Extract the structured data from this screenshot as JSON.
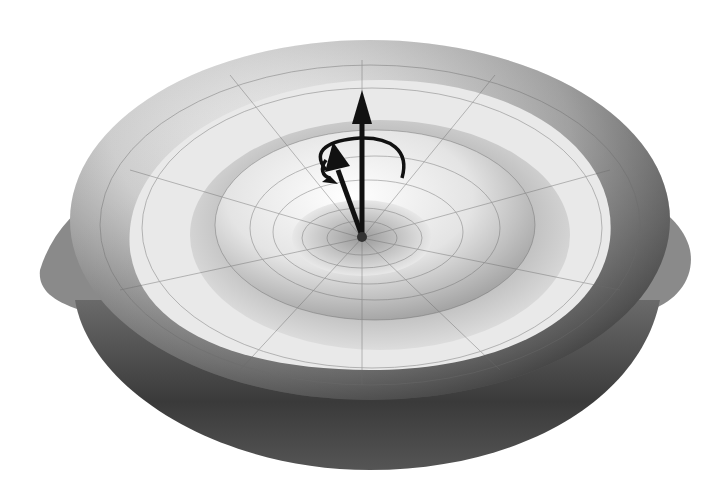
{
  "image": {
    "subject": "3D rendered potential surface (Mexican hat / sombrero) with vectors",
    "background_color": "#ffffff",
    "surface_colors": {
      "light": "#f2f2f2",
      "mid": "#c8c8c8",
      "dark": "#4a4a4a",
      "shadow": "#2a2a2a"
    },
    "arrow_color": "#111111",
    "elements": [
      "outer-bowl",
      "inner-rim-ring",
      "central-dome",
      "vertical-arrow",
      "tilted-arrow",
      "rotation-arrow"
    ]
  }
}
